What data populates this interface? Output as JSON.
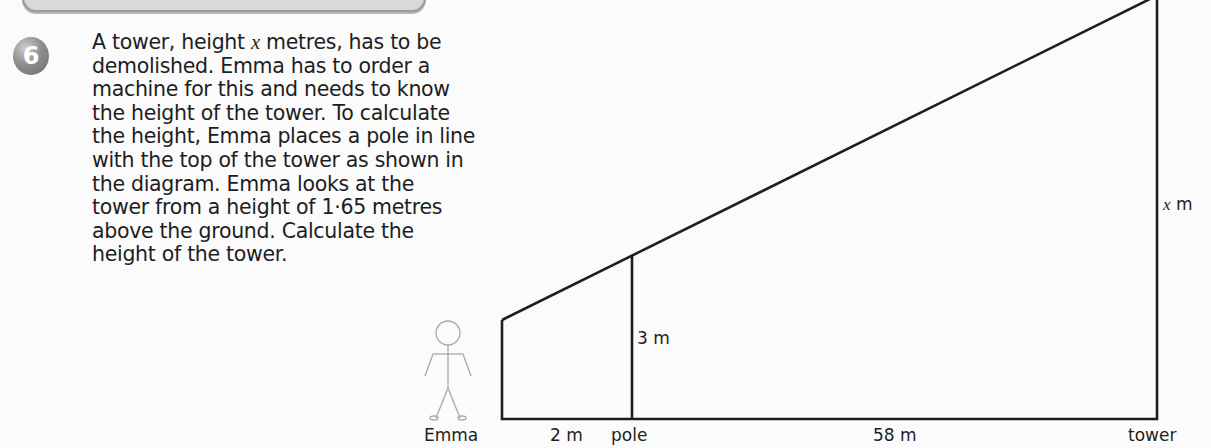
{
  "question": {
    "number": "6",
    "lines": [
      [
        "A tower, height ",
        "x",
        " metres, has to be"
      ],
      [
        "demolished. Emma has to order a"
      ],
      [
        "machine for this and needs to know"
      ],
      [
        "the height of the tower. To calculate"
      ],
      [
        "the height, Emma places a pole in line"
      ],
      [
        "with the top of the tower as shown in"
      ],
      [
        "the diagram. Emma looks at the"
      ],
      [
        "tower from a height of 1·65 metres"
      ],
      [
        "above the ground. Calculate the"
      ],
      [
        "height of the tower."
      ]
    ]
  },
  "diagram": {
    "labels": {
      "pole_height": "3 m",
      "tower_height_var": "x",
      "tower_height_unit": " m",
      "emma": "Emma",
      "emma_to_pole": "2 m",
      "pole": "pole",
      "pole_to_tower": "58 m",
      "tower": "tower"
    },
    "values": {
      "eye_height_m": 1.65,
      "pole_height_m": 3,
      "emma_to_pole_m": 2,
      "pole_to_tower_m": 58
    }
  }
}
